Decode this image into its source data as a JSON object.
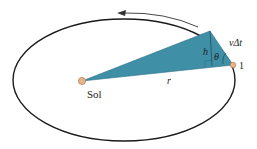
{
  "diagram": {
    "colors": {
      "orbit": "#1a1a1a",
      "swept_area": "#3f8fa6",
      "sun": "#e8b48a",
      "planet": "#e8b48a",
      "arrow": "#333333",
      "background": "#ffffff"
    },
    "labels": {
      "sun": "Sol",
      "radius": "r",
      "height": "h",
      "angle": "θ",
      "displacement_v": "v",
      "displacement_dt": "Δt",
      "planet": "1"
    },
    "orbit_direction": "counterclockwise"
  }
}
